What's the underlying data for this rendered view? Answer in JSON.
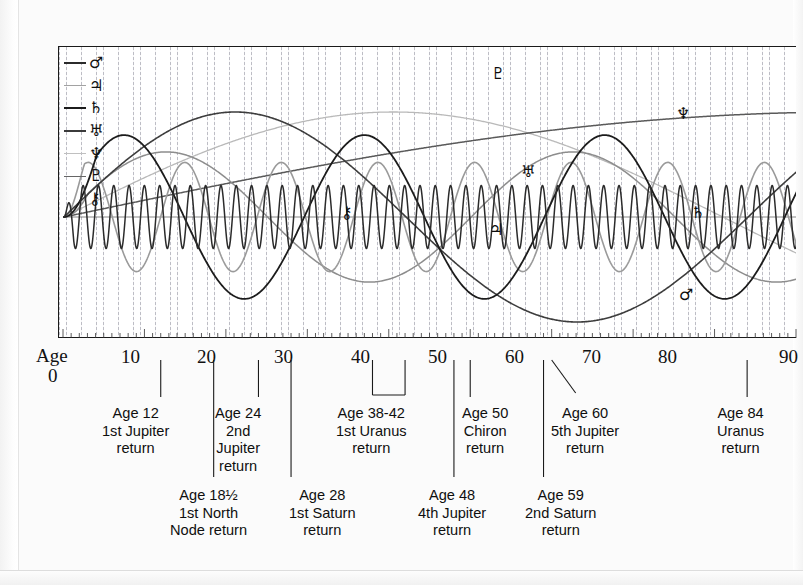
{
  "chart_data": {
    "type": "line",
    "title": "",
    "xlabel": "Age",
    "ylabel": "",
    "xlim": [
      0,
      90
    ],
    "ylim": [
      -1.15,
      1.15
    ],
    "grid": true,
    "legend_position": "top-left inside",
    "x_tick_labels": [
      "10",
      "20",
      "30",
      "40",
      "50",
      "60",
      "70",
      "80",
      "90"
    ],
    "x_tick_values": [
      10,
      20,
      30,
      40,
      50,
      60,
      70,
      80,
      90
    ],
    "axis_origin_label_line1": "Age",
    "axis_origin_label_line2": "0",
    "series": [
      {
        "name": "Mars",
        "symbol": "♂",
        "color": "#2b2b2b",
        "period_years": 1.88,
        "amplitude": 0.3,
        "description": "fast small-amplitude oscillation across the whole age range"
      },
      {
        "name": "Jupiter",
        "symbol": "♃",
        "color": "#9a9a9a",
        "period_years": 11.86,
        "amplitude": 0.52,
        "description": "medium grey wave, returns at ages 12, 24, 36, 48, 60"
      },
      {
        "name": "Saturn",
        "symbol": "♄",
        "color": "#1c1c1c",
        "period_years": 29.5,
        "amplitude": 0.78,
        "description": "dark slow wave, returns at ages 28-29 and 59"
      },
      {
        "name": "Uranus",
        "symbol": "♅",
        "color": "#3d3d3d",
        "period_years": 84,
        "amplitude": 1.0,
        "description": "single broad arch peaking near age 42, returning to axis near age 84"
      },
      {
        "name": "Neptune",
        "symbol": "♆",
        "color": "#b9b9b9",
        "period_years": 165,
        "amplitude": 1.0,
        "description": "pale rising curve, still climbing at age 90"
      },
      {
        "name": "Pluto",
        "symbol": "♇",
        "color": "#5a5a5a",
        "period_years": 248,
        "amplitude": 1.0,
        "description": "topmost rising curve flattening after age 60"
      },
      {
        "name": "Chiron",
        "symbol": "⚷",
        "color": "#8d8d8d",
        "period_years": 50,
        "amplitude": 0.62,
        "description": "grey wave peaking near age 38 and returning near age 50"
      }
    ],
    "annotations": [
      {
        "age": 12,
        "line1": "Age 12",
        "line2": "1st Jupiter",
        "line3": "return"
      },
      {
        "age": 18.5,
        "line1": "Age 18½",
        "line2": "1st North",
        "line3": "Node return"
      },
      {
        "age": 24,
        "line1": "Age 24",
        "line2": "2nd",
        "line3": "Jupiter",
        "line4": "return"
      },
      {
        "age": 28,
        "line1": "Age 28",
        "line2": "1st Saturn",
        "line3": "return"
      },
      {
        "age": 40,
        "line1": "Age 38-42",
        "line2": "1st Uranus",
        "line3": "return"
      },
      {
        "age": 48,
        "line1": "Age 48",
        "line2": "4th Jupiter",
        "line3": "return"
      },
      {
        "age": 50,
        "line1": "Age 50",
        "line2": "Chiron",
        "line3": "return"
      },
      {
        "age": 59,
        "line1": "Age 59",
        "line2": "2nd Saturn",
        "line3": "return"
      },
      {
        "age": 60,
        "line1": "Age 60",
        "line2": "5th Jupiter",
        "line3": "return"
      },
      {
        "age": 84,
        "line1": "Age 84",
        "line2": "Uranus",
        "line3": "return"
      }
    ]
  },
  "legend": {
    "items": [
      {
        "symbol": "♂",
        "name": "Mars",
        "color": "#2b2b2b",
        "weight": "2.0px"
      },
      {
        "symbol": "♃",
        "name": "Jupiter",
        "color": "#a2a2a2",
        "weight": "1.6px"
      },
      {
        "symbol": "♄",
        "name": "Saturn",
        "color": "#1c1c1c",
        "weight": "2.2px"
      },
      {
        "symbol": "♅",
        "name": "Uranus",
        "color": "#3b3b3b",
        "weight": "2.0px"
      },
      {
        "symbol": "♆",
        "name": "Neptune",
        "color": "#c0c0c0",
        "weight": "1.4px"
      },
      {
        "symbol": "♇",
        "name": "Pluto",
        "color": "#666666",
        "weight": "1.8px"
      },
      {
        "symbol": "⚷",
        "name": "Chiron",
        "color": "#8d8d8d",
        "weight": "0px"
      }
    ]
  },
  "curve_labels": [
    {
      "symbol": "♇",
      "name": "pluto-label",
      "left": 491,
      "top": 66
    },
    {
      "symbol": "♆",
      "name": "neptune-label",
      "left": 676,
      "top": 106
    },
    {
      "symbol": "♅",
      "name": "uranus-label",
      "left": 521,
      "top": 164
    },
    {
      "symbol": "⚷",
      "name": "chiron-label",
      "left": 341,
      "top": 205
    },
    {
      "symbol": "♃",
      "name": "jupiter-label",
      "left": 489,
      "top": 222
    },
    {
      "symbol": "♄",
      "name": "saturn-label",
      "left": 691,
      "top": 205
    },
    {
      "symbol": "♂",
      "name": "mars-label",
      "left": 679,
      "top": 287
    }
  ],
  "annotations_top_row": [
    {
      "name": "annotation-age-12",
      "left": 102,
      "lines": [
        "Age 12",
        "1st Jupiter",
        "return"
      ]
    },
    {
      "name": "annotation-age-24",
      "left": 215,
      "lines": [
        "Age 24",
        "2nd",
        "Jupiter",
        "return"
      ]
    },
    {
      "name": "annotation-age-38-42",
      "left": 336,
      "lines": [
        "Age 38-42",
        "1st Uranus",
        "return"
      ]
    },
    {
      "name": "annotation-age-50",
      "left": 462,
      "lines": [
        "Age 50",
        "Chiron",
        "return"
      ]
    },
    {
      "name": "annotation-age-60",
      "left": 551,
      "lines": [
        "Age 60",
        "5th Jupiter",
        "return"
      ]
    },
    {
      "name": "annotation-age-84",
      "left": 717,
      "lines": [
        "Age 84",
        "Uranus",
        "return"
      ]
    }
  ],
  "annotations_bottom_row": [
    {
      "name": "annotation-age-18-half",
      "left": 170,
      "lines": [
        "Age 18½",
        "1st North",
        "Node return"
      ]
    },
    {
      "name": "annotation-age-28",
      "left": 289,
      "lines": [
        "Age 28",
        "1st Saturn",
        "return"
      ]
    },
    {
      "name": "annotation-age-48",
      "left": 418,
      "lines": [
        "Age 48",
        "4th Jupiter",
        "return"
      ]
    },
    {
      "name": "annotation-age-59",
      "left": 525,
      "lines": [
        "Age 59",
        "2nd Saturn",
        "return"
      ]
    }
  ],
  "axis": {
    "age_word": "Age",
    "age_zero": "0",
    "ticks": [
      {
        "label": "10",
        "left": 121
      },
      {
        "label": "20",
        "left": 197
      },
      {
        "label": "30",
        "left": 274
      },
      {
        "label": "40",
        "left": 351
      },
      {
        "label": "50",
        "left": 428
      },
      {
        "label": "60",
        "left": 505
      },
      {
        "label": "70",
        "left": 582
      },
      {
        "label": "80",
        "left": 658
      },
      {
        "label": "90",
        "left": 779
      }
    ]
  }
}
